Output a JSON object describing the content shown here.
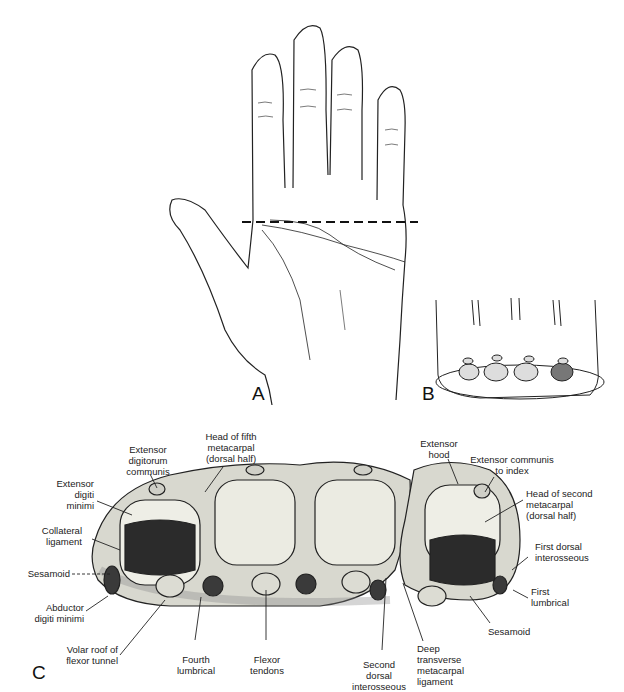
{
  "figure": {
    "panels": [
      {
        "id": "A",
        "label": "A",
        "description": "Palmar view of hand with dashed transverse section line across distal palm"
      },
      {
        "id": "B",
        "label": "B",
        "description": "Oblique view of sectioned hand showing four metacarpal heads"
      },
      {
        "id": "C",
        "label": "C",
        "description": "Cross-section at level of metacarpal heads"
      }
    ],
    "labels_c": {
      "extensor_digitorum_communis": "Extensor\ndigitorum\ncommunis",
      "head_fifth_metacarpal": "Head of fifth\nmetacarpal\n(dorsal half)",
      "extensor_digiti_minimi": "Extensor\ndigiti\nminimi",
      "collateral_ligament": "Collateral\nligament",
      "sesamoid_left": "Sesamoid",
      "abductor_digiti_minimi": "Abductor\ndigiti minimi",
      "volar_roof": "Volar roof of\nflexor tunnel",
      "fourth_lumbrical": "Fourth\nlumbrical",
      "flexor_tendons": "Flexor\ntendons",
      "second_dorsal_interosseous": "Second\ndorsal\ninterosseous",
      "deep_transverse_ligament": "Deep\ntransverse\nmetacarpal\nligament",
      "sesamoid_right": "Sesamoid",
      "first_lumbrical": "First\nlumbrical",
      "first_dorsal_interosseous": "First dorsal\ninterosseous",
      "head_second_metacarpal": "Head of second\nmetacarpal\n(dorsal half)",
      "extensor_communis_index": "Extensor communis\nto index",
      "extensor_hood": "Extensor\nhood"
    }
  }
}
